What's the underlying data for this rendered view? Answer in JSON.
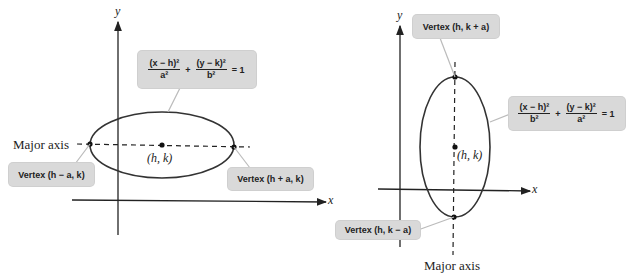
{
  "left_diagram": {
    "axis_x_label": "x",
    "axis_y_label": "y",
    "major_axis_label": "Major axis",
    "center_label": "(h, k)",
    "vertex_left_label": "Vertex (h − a, k)",
    "vertex_right_label": "Vertex (h + a, k)",
    "equation": {
      "term1_num": "(x − h)²",
      "term1_den": "a²",
      "plus": "+",
      "term2_num": "(y − k)²",
      "term2_den": "b²",
      "rhs": "= 1"
    }
  },
  "right_diagram": {
    "axis_x_label": "x",
    "axis_y_label": "y",
    "major_axis_label": "Major axis",
    "center_label": "(h, k)",
    "vertex_top_label": "Vertex (h, k + a)",
    "vertex_bottom_label": "Vertex (h, k − a)",
    "equation": {
      "term1_num": "(x − h)²",
      "term1_den": "b²",
      "plus": "+",
      "term2_num": "(y − k)²",
      "term2_den": "a²",
      "rhs": "= 1"
    }
  },
  "colors": {
    "line": "#222222",
    "callout_bg": "#d9d9d9"
  }
}
